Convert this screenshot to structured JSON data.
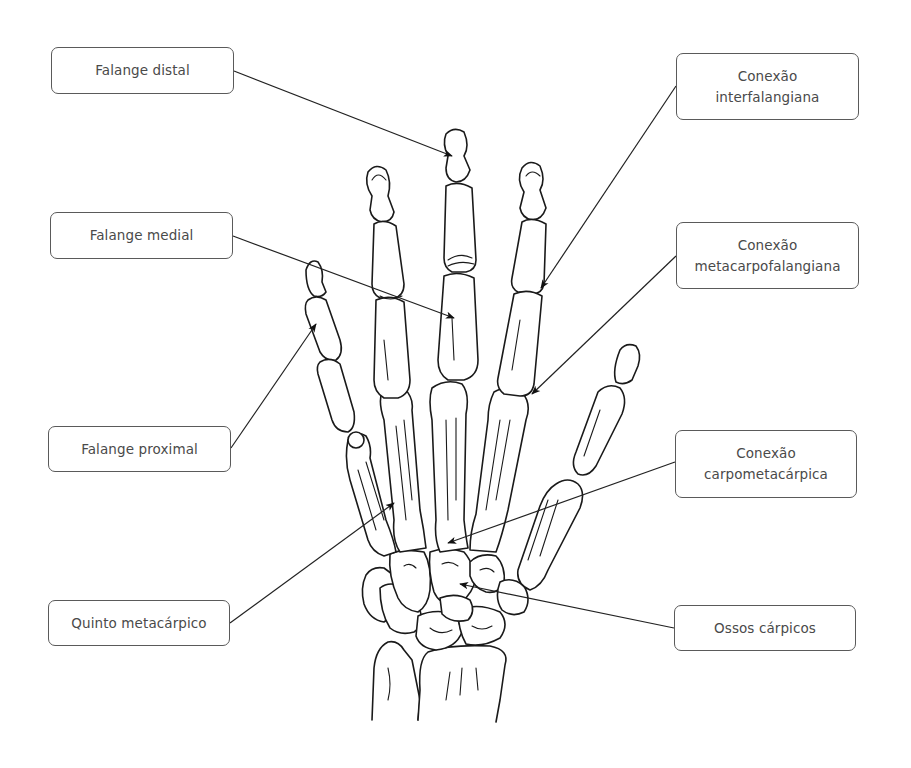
{
  "diagram": {
    "labels": {
      "falange_distal": {
        "lines": [
          "Falange distal"
        ]
      },
      "falange_medial": {
        "lines": [
          "Falange medial"
        ]
      },
      "falange_proximal": {
        "lines": [
          "Falange proximal"
        ]
      },
      "quinto_metacarpico": {
        "lines": [
          "Quinto metacárpico"
        ]
      },
      "conexao_interfalangiana": {
        "lines": [
          "Conexão",
          "interfalangiana"
        ]
      },
      "conexao_metacarpofalangiana": {
        "lines": [
          "Conexão",
          "metacarpofalangiana"
        ]
      },
      "conexao_carpometacarpica": {
        "lines": [
          "Conexão",
          "carpometacárpica"
        ]
      },
      "ossos_carpicos": {
        "lines": [
          "Ossos cárpicos"
        ]
      }
    },
    "colors": {
      "line": "#1a1a1a",
      "box_border": "#5a5a5a",
      "text": "#4a4a4a",
      "background": "#ffffff"
    }
  }
}
